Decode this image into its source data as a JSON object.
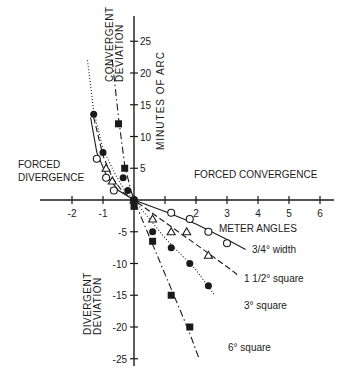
{
  "chart_data": {
    "type": "scatter",
    "title": "",
    "xlabel": "METER ANGLES",
    "ylabel": "MINUTES OF ARC",
    "xlim": [
      -2.5,
      6.5
    ],
    "ylim": [
      -27,
      29
    ],
    "x_ticks": [
      -2,
      -1,
      1,
      2,
      3,
      4,
      5,
      6
    ],
    "x_tick_labels": [
      "-2",
      "-1",
      "",
      "2",
      "3",
      "4",
      "5",
      "6"
    ],
    "y_ticks": [
      25,
      20,
      15,
      10,
      5,
      -5,
      -10,
      -15,
      -20,
      -25
    ],
    "y_tick_labels": [
      "25",
      "20",
      "15",
      "10",
      "5",
      "-5",
      "-10",
      "-15",
      "-20",
      "-25"
    ],
    "grid": false,
    "annotations": {
      "upper_left_quadrant_top": "CONVERGENT DEVIATION",
      "left_region": "FORCED DIVERGENCE",
      "right_region": "FORCED CONVERGENCE",
      "lower_left_quadrant": "DIVERGENT DEVIATION"
    },
    "series": [
      {
        "name": "3/4° width",
        "marker": "open-circle",
        "line": "solid",
        "points": [
          [
            -1.2,
            6.5
          ],
          [
            -0.9,
            3.5
          ],
          [
            -0.65,
            1.5
          ],
          [
            0,
            0
          ],
          [
            1.2,
            -2
          ],
          [
            1.8,
            -3
          ],
          [
            2.4,
            -5
          ],
          [
            3.0,
            -6.8
          ]
        ],
        "curve": [
          [
            -1.4,
            13
          ],
          [
            -1.2,
            7.5
          ],
          [
            -0.9,
            4
          ],
          [
            -0.5,
            1.5
          ],
          [
            0,
            0
          ],
          [
            1,
            -1.8
          ],
          [
            2,
            -3.8
          ],
          [
            3,
            -6.2
          ],
          [
            3.6,
            -7.8
          ]
        ]
      },
      {
        "name": "1 1/2° square",
        "marker": "open-triangle",
        "line": "dashed",
        "points": [
          [
            -0.9,
            5
          ],
          [
            -0.7,
            3
          ],
          [
            0,
            0
          ],
          [
            0.6,
            -3
          ],
          [
            1.2,
            -5
          ],
          [
            1.7,
            -5
          ],
          [
            2.4,
            -8.7
          ]
        ],
        "curve": [
          [
            -1.3,
            13
          ],
          [
            -1.0,
            7
          ],
          [
            -0.7,
            3.5
          ],
          [
            -0.35,
            1.2
          ],
          [
            0,
            0
          ],
          [
            1,
            -3.5
          ],
          [
            2,
            -7
          ],
          [
            3,
            -10.5
          ],
          [
            3.4,
            -12
          ]
        ]
      },
      {
        "name": "3° square",
        "marker": "filled-circle",
        "line": "dotted",
        "points": [
          [
            -1.3,
            13.5
          ],
          [
            -1.0,
            7.5
          ],
          [
            -0.35,
            3.5
          ],
          [
            -0.2,
            1.5
          ],
          [
            0,
            0
          ],
          [
            0.6,
            -5
          ],
          [
            1.2,
            -7.5
          ],
          [
            1.8,
            -10
          ],
          [
            2.4,
            -13.5
          ]
        ],
        "curve": [
          [
            -1.5,
            22
          ],
          [
            -1.3,
            14
          ],
          [
            -1.0,
            8
          ],
          [
            -0.6,
            4
          ],
          [
            -0.3,
            1.5
          ],
          [
            0,
            0
          ],
          [
            1,
            -6
          ],
          [
            2,
            -11
          ],
          [
            2.6,
            -15
          ]
        ]
      },
      {
        "name": "6° square",
        "marker": "filled-square",
        "line": "dash-dot",
        "points": [
          [
            -0.5,
            12
          ],
          [
            -0.3,
            5
          ],
          [
            0,
            -1
          ],
          [
            0.6,
            -6.5
          ],
          [
            1.2,
            -15
          ],
          [
            1.8,
            -20
          ]
        ],
        "curve": [
          [
            -0.7,
            22
          ],
          [
            -0.5,
            13
          ],
          [
            -0.3,
            5.5
          ],
          [
            -0.1,
            1.5
          ],
          [
            0,
            0
          ],
          [
            0.6,
            -7
          ],
          [
            1.2,
            -14
          ],
          [
            1.8,
            -21
          ],
          [
            2.1,
            -25
          ]
        ]
      }
    ],
    "legend_position": "inline labels at right end of each curve"
  },
  "labels": {
    "convergent_deviation_line1": "CONVERGENT",
    "convergent_deviation_line2": "DEVIATION",
    "divergent_deviation_line1": "DIVERGENT",
    "divergent_deviation_line2": "DEVIATION",
    "forced_divergence_line1": "FORCED",
    "forced_divergence_line2": "DIVERGENCE",
    "forced_convergence": "FORCED CONVERGENCE",
    "meter_angles": "METER ANGLES",
    "minutes_of_arc": "MINUTES OF ARC",
    "series_3_4_width": "3/4° width",
    "series_1_5_square": "1 1/2° square",
    "series_3_square": "3° square",
    "series_6_square": "6° square"
  }
}
